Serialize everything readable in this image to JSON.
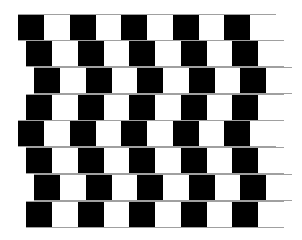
{
  "figure": {
    "colors": {
      "dark": "#000000",
      "light": "#ffffff",
      "mortar": "#a0a0a0",
      "background": "#ffffff"
    },
    "tile_width": 26,
    "period": 51.5,
    "tiles_per_row": 10,
    "rows": [
      {
        "top": 14,
        "offset": 18
      },
      {
        "top": 40,
        "offset": 26
      },
      {
        "top": 67,
        "offset": 34
      },
      {
        "top": 94,
        "offset": 26
      },
      {
        "top": 120,
        "offset": 18
      },
      {
        "top": 147,
        "offset": 26
      },
      {
        "top": 174,
        "offset": 34
      },
      {
        "top": 201,
        "offset": 26
      }
    ]
  }
}
